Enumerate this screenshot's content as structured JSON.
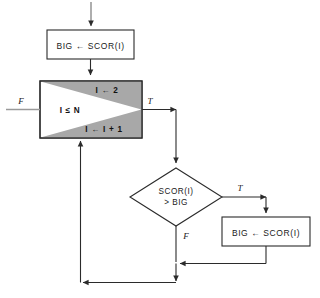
{
  "diagram": {
    "nodes": {
      "init_box": {
        "text": "BIG ← SCOR(I)"
      },
      "loop_box": {
        "init": "I ← 2",
        "condition": "I ≤ N",
        "increment": "I ← I + 1"
      },
      "decision": {
        "line1": "SCOR(I)",
        "line2": "> BIG"
      },
      "update_box": {
        "text": "BIG ← SCOR(I)"
      }
    },
    "labels": {
      "loop_false": "F",
      "loop_true": "T",
      "decision_true": "T",
      "decision_false": "F"
    },
    "colors": {
      "shade": "#a8a8a8",
      "line": "#2b2b2b",
      "box_fill": "#ffffff",
      "background": "#ffffff"
    }
  }
}
